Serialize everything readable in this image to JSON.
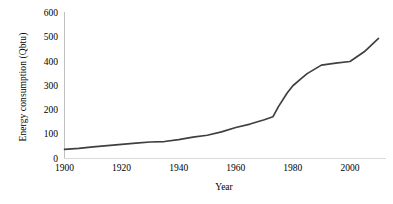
{
  "chart_data": {
    "type": "line",
    "title": "",
    "xlabel": "Year",
    "ylabel": "Energy consumption (Qbtu)",
    "xlim": [
      1900,
      2010
    ],
    "ylim": [
      0,
      600
    ],
    "grid": false,
    "legend": false,
    "line_color": "#3f3f3f",
    "axis_color": "#bfbfbf",
    "xticks": [
      1900,
      1920,
      1940,
      1960,
      1980,
      2000
    ],
    "xtick_labels": [
      "1900",
      "1920",
      "1940",
      "1960",
      "1980",
      "2000"
    ],
    "yticks": [
      0,
      100,
      200,
      300,
      400,
      500,
      600
    ],
    "ytick_labels": [
      "0",
      "100",
      "200",
      "300",
      "400",
      "500",
      "600"
    ],
    "series": [
      {
        "name": "Energy consumption",
        "x": [
          1900,
          1905,
          1910,
          1915,
          1920,
          1925,
          1930,
          1935,
          1940,
          1945,
          1950,
          1955,
          1960,
          1965,
          1970,
          1973,
          1975,
          1978,
          1980,
          1983,
          1985,
          1990,
          1995,
          2000,
          2005,
          2010
        ],
        "values": [
          38,
          42,
          48,
          53,
          58,
          63,
          68,
          70,
          78,
          88,
          96,
          110,
          128,
          142,
          160,
          172,
          215,
          270,
          300,
          330,
          350,
          385,
          393,
          400,
          440,
          495
        ]
      }
    ]
  }
}
